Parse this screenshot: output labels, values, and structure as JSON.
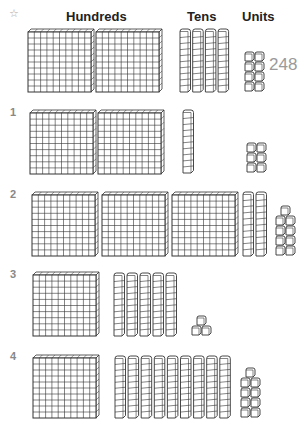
{
  "header": {
    "star_icon": "☆",
    "columns": [
      "Hundreds",
      "Tens",
      "Units"
    ]
  },
  "example": {
    "hundreds": 2,
    "tens": 4,
    "units": 8,
    "answer": "248"
  },
  "rows": [
    {
      "label": "1",
      "hundreds": 2,
      "tens": 1,
      "units": 6
    },
    {
      "label": "2",
      "hundreds": 3,
      "tens": 2,
      "units": 9
    },
    {
      "label": "3",
      "hundreds": 1,
      "tens": 5,
      "units": 3
    },
    {
      "label": "4",
      "hundreds": 1,
      "tens": 9,
      "units": 9
    }
  ],
  "colors": {
    "line": "#333333",
    "label": "#888888",
    "answer": "#9a9a9a"
  }
}
